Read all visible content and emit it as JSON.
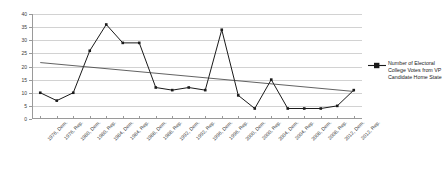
{
  "chart_data": {
    "type": "line",
    "title": "",
    "xlabel": "",
    "ylabel": "",
    "ylim": [
      0,
      40
    ],
    "yticks": [
      40,
      35,
      30,
      25,
      20,
      15,
      10,
      5,
      0
    ],
    "grid": true,
    "legend_position": "right",
    "categories": [
      "1976, Dem.",
      "1976, Rep.",
      "1980, Dem.",
      "1980, Rep.",
      "1984, Dem.",
      "1984, Rep.",
      "1988, Dem.",
      "1988, Rep.",
      "1992, Dem.",
      "1992, Rep.",
      "1996, Dem.",
      "1996, Rep.",
      "2000, Dem.",
      "2000, Rep.",
      "2004, Dem.",
      "2004, Rep.",
      "2008, Dem.",
      "2008, Rep.",
      "2012, Dem.",
      "2012, Rep."
    ],
    "series": [
      {
        "name": "Number of Electoral College Votes from VP Candidate Home State",
        "color": "#1a1a1a",
        "marker": "square",
        "values": [
          10,
          7,
          10,
          26,
          36,
          29,
          29,
          12,
          11,
          12,
          11,
          34,
          9,
          4,
          15,
          4,
          4,
          4,
          5,
          11
        ]
      },
      {
        "name": "Linear trendline",
        "color": "#3a3a3a",
        "marker": "none",
        "trendline": true,
        "start_value": 21.5,
        "end_value": 10.5
      }
    ]
  },
  "legend": {
    "entries": [
      {
        "label": "Number of Electoral College Votes from VP Candidate Home State",
        "marker_color": "#1a1a1a"
      }
    ]
  }
}
